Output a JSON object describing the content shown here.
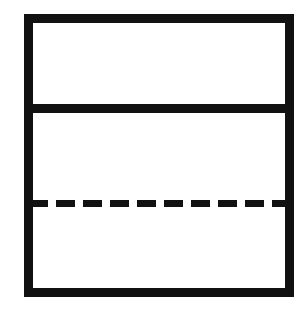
{
  "canvas": {
    "width": 307,
    "height": 311,
    "background": "#ffffff"
  },
  "figure": {
    "title": "",
    "stroke_color": "#111111",
    "fill_color": "#ffffff"
  },
  "chart_data": {
    "type": "diagram",
    "title": "",
    "shapes": [
      {
        "name": "outer-rectangle",
        "kind": "rectangle",
        "x": 28.5,
        "y": 18.5,
        "width": 261,
        "height": 274,
        "stroke_width": 9,
        "stroke": "#111111",
        "fill": "none",
        "line_style": "solid"
      },
      {
        "name": "solid-divider-line",
        "kind": "line",
        "x1": 24,
        "y1": 108.5,
        "x2": 294,
        "y2": 108.5,
        "stroke_width": 9,
        "stroke": "#111111",
        "line_style": "solid"
      },
      {
        "name": "dashed-divider-line",
        "kind": "line",
        "x1": 29,
        "y1": 203.5,
        "x2": 290,
        "y2": 203.5,
        "stroke_width": 7,
        "stroke": "#111111",
        "line_style": "dashed",
        "dash_length": 19,
        "gap_length": 8,
        "dash_count": 9
      }
    ],
    "regions": [
      {
        "name": "top-band",
        "y_top": 18,
        "y_bottom": 108,
        "fill": "#ffffff"
      },
      {
        "name": "middle-band",
        "y_top": 108,
        "y_bottom": 203,
        "fill": "#ffffff"
      },
      {
        "name": "bottom-band",
        "y_top": 203,
        "y_bottom": 292,
        "fill": "#ffffff"
      }
    ],
    "labels": [],
    "legend": [],
    "grid": false
  }
}
